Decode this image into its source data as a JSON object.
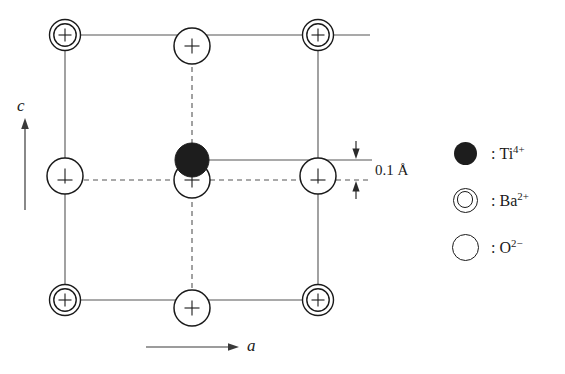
{
  "figure": {
    "kind": "crystal-structure-diagram",
    "background_color": "#ffffff",
    "line_color": "#555555",
    "ion_outline_color": "#1a1a1a",
    "ti_fill_color": "#1d1d1d"
  },
  "axes": {
    "vertical": {
      "label": "c",
      "direction": "up"
    },
    "horizontal": {
      "label": "a",
      "direction": "right"
    }
  },
  "annotation": {
    "offset_label": "0.1 Å",
    "offset_value": 0.1,
    "offset_unit": "Å",
    "description": "vertical displacement of Ti4+ from the oxygen plane"
  },
  "legend": {
    "items": [
      {
        "symbol": "filled-circle",
        "icon_name": "ti-ion-icon",
        "separator": ":",
        "species": "Ti",
        "charge": "4+",
        "label": "Ti"
      },
      {
        "symbol": "double-circle",
        "icon_name": "ba-ion-icon",
        "separator": ":",
        "species": "Ba",
        "charge": "2+",
        "label": "Ba"
      },
      {
        "symbol": "open-circle",
        "icon_name": "o-ion-icon",
        "separator": ":",
        "species": "O",
        "charge": "2−",
        "label": "O"
      }
    ]
  },
  "cell": {
    "left": 65,
    "right": 318,
    "top": 35,
    "bottom": 300,
    "mid_x": 192,
    "mid_y": 176
  },
  "atoms": [
    {
      "id": "ba-top-left",
      "species": "Ba",
      "charge": "2+",
      "x": 65,
      "y": 35,
      "type": "double-circle",
      "crosshair": true
    },
    {
      "id": "ba-top-right",
      "species": "Ba",
      "charge": "2+",
      "x": 318,
      "y": 35,
      "type": "double-circle",
      "crosshair": true
    },
    {
      "id": "ba-bottom-left",
      "species": "Ba",
      "charge": "2+",
      "x": 65,
      "y": 300,
      "type": "double-circle",
      "crosshair": true
    },
    {
      "id": "ba-bottom-right",
      "species": "Ba",
      "charge": "2+",
      "x": 318,
      "y": 300,
      "type": "double-circle",
      "crosshair": true
    },
    {
      "id": "o-top-middle",
      "species": "O",
      "charge": "2−",
      "x": 192,
      "y": 46,
      "type": "open-circle",
      "crosshair": true
    },
    {
      "id": "o-bottom-middle",
      "species": "O",
      "charge": "2−",
      "x": 192,
      "y": 308,
      "type": "open-circle",
      "crosshair": true
    },
    {
      "id": "o-left-middle",
      "species": "O",
      "charge": "2−",
      "x": 65,
      "y": 176,
      "type": "open-circle",
      "crosshair": true
    },
    {
      "id": "o-right-middle",
      "species": "O",
      "charge": "2−",
      "x": 318,
      "y": 176,
      "type": "open-circle",
      "crosshair": true
    },
    {
      "id": "o-center",
      "species": "O",
      "charge": "2−",
      "x": 192,
      "y": 180,
      "type": "open-circle",
      "crosshair": true
    },
    {
      "id": "ti-center",
      "species": "Ti",
      "charge": "4+",
      "x": 192,
      "y": 160,
      "type": "filled-circle",
      "crosshair": false
    }
  ]
}
